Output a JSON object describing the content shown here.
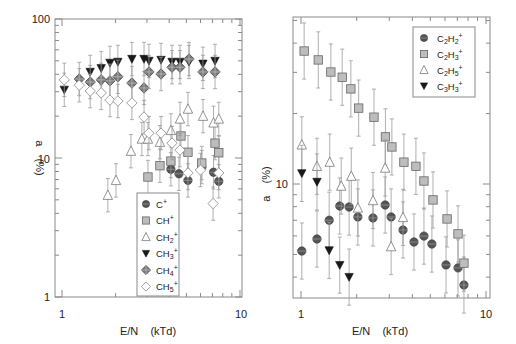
{
  "chart_data": [
    {
      "type": "scatter",
      "title": "",
      "xlabel": "E/N    (kTd)",
      "ylabel": "a    (%)",
      "xscale": "log",
      "yscale": "log",
      "xlim": [
        0.96,
        10.1
      ],
      "ylim": [
        1,
        100
      ],
      "xticks": [
        {
          "value": 1,
          "label": "1"
        },
        {
          "value": 10,
          "label": "10"
        }
      ],
      "yticks": [
        {
          "value": 1,
          "label": "1"
        },
        {
          "value": 10,
          "label": "10"
        },
        {
          "value": 100,
          "label": "100"
        }
      ],
      "legend_position": "bottom-center",
      "series": [
        {
          "name": "C+",
          "base": "C",
          "sub": "",
          "sup": "+",
          "marker": "circle",
          "color": "#555555",
          "x": [
            4.09,
            4.54,
            5.1,
            6.1,
            7.1,
            7.6
          ],
          "y": [
            8.3,
            7.7,
            6.9,
            8.6,
            7.9,
            6.8
          ]
        },
        {
          "name": "CH+",
          "base": "CH",
          "sub": "",
          "sup": "+",
          "marker": "square",
          "color": "#bdbdbd",
          "x": [
            3.04,
            3.55,
            4.09,
            4.66,
            5.1,
            6.1,
            7.24,
            7.6
          ],
          "y": [
            7.3,
            8.8,
            9.5,
            14.4,
            11.0,
            9.2,
            12.8,
            10.9
          ]
        },
        {
          "name": "CH2+",
          "base": "CH",
          "sub": "2",
          "sup": "+",
          "marker": "triangle-up",
          "color": "#ffffff",
          "x": [
            1.81,
            2.01,
            2.44,
            2.81,
            3.04,
            3.55,
            4.09,
            4.6,
            5.1,
            6.2,
            7.1,
            7.6
          ],
          "y": [
            5.4,
            6.9,
            11.2,
            13.7,
            13.7,
            13.0,
            15.8,
            19.1,
            22.5,
            20.0,
            17.9,
            19.1
          ]
        },
        {
          "name": "CH3+",
          "base": "CH",
          "sub": "3",
          "sup": "+",
          "marker": "triangle-down",
          "color": "#1a1a1a",
          "x": [
            1.03,
            1.44,
            1.66,
            1.86,
            2.06,
            2.47,
            2.89,
            3.08,
            3.6,
            4.15,
            4.6,
            5.17,
            6.19,
            7.24
          ],
          "y": [
            30.9,
            41.6,
            44.2,
            48.3,
            49.1,
            51.5,
            51.5,
            49.9,
            50.7,
            49.1,
            49.1,
            49.1,
            47.6,
            49.9
          ]
        },
        {
          "name": "CH4+",
          "base": "CH",
          "sub": "4",
          "sup": "+",
          "marker": "diamond-cross",
          "color": "#7a7a7a",
          "x": [
            1.25,
            1.44,
            1.66,
            1.86,
            2.06,
            2.47,
            2.89,
            3.08,
            3.6,
            4.15,
            4.6,
            5.17,
            6.19,
            7.24
          ],
          "y": [
            37.0,
            35.2,
            36.5,
            35.9,
            38.4,
            34.6,
            31.9,
            41.6,
            40.2,
            45.0,
            45.0,
            51.5,
            41.6,
            41.6
          ]
        },
        {
          "name": "CH5+",
          "base": "CH",
          "sub": "5",
          "sup": "+",
          "marker": "diamond",
          "color": "#ffffff",
          "x": [
            1.03,
            1.25,
            1.44,
            1.66,
            1.86,
            2.06,
            2.47,
            2.89,
            3.08,
            3.6,
            4.15,
            4.6,
            5.1,
            6.0,
            7.06,
            7.6
          ],
          "y": [
            36.5,
            33.4,
            30.3,
            29.4,
            26.1,
            25.7,
            24.9,
            19.7,
            15.1,
            15.1,
            12.8,
            11.4,
            7.8,
            8.2,
            4.7,
            7.8
          ]
        }
      ]
    },
    {
      "type": "scatter",
      "title": "",
      "xlabel": "E/N    (kTd)",
      "ylabel": "a    (%)",
      "xscale": "log",
      "yscale": "log",
      "xlim": [
        0.96,
        10.2
      ],
      "ylim": [
        3.2,
        52
      ],
      "xticks": [
        {
          "value": 1,
          "label": "1"
        },
        {
          "value": 10,
          "label": "10"
        }
      ],
      "yticks": [
        {
          "value": 10,
          "label": "10"
        }
      ],
      "legend_position": "top-right",
      "series": [
        {
          "name": "C2H2+",
          "base": "C",
          "sub": "2",
          "mid": "H",
          "sub2": "2",
          "sup": "+",
          "marker": "circle",
          "color": "#555555",
          "x": [
            1.01,
            1.22,
            1.42,
            1.62,
            1.82,
            2.03,
            2.45,
            2.85,
            3.07,
            3.56,
            4.08,
            4.62,
            5.1,
            6.08,
            7.06,
            7.6
          ],
          "y": [
            5.17,
            5.82,
            7.0,
            8.05,
            7.97,
            7.23,
            7.16,
            8.13,
            7.23,
            6.36,
            5.65,
            5.99,
            5.54,
            4.51,
            4.38,
            3.7
          ]
        },
        {
          "name": "C2H3+",
          "base": "C",
          "sub": "2",
          "mid": "H",
          "sub2": "3",
          "sup": "+",
          "marker": "square",
          "color": "#bdbdbd",
          "x": [
            1.04,
            1.24,
            1.45,
            1.67,
            1.86,
            2.05,
            2.48,
            2.86,
            3.1,
            3.6,
            4.18,
            4.62,
            5.17,
            6.16,
            7.06,
            7.6
          ],
          "y": [
            37.0,
            33.9,
            30.1,
            28.6,
            25.5,
            21.1,
            19.3,
            15.9,
            14.4,
            12.4,
            11.9,
            10.3,
            8.55,
            7.09,
            6.12,
            4.59
          ]
        },
        {
          "name": "C2H5+",
          "base": "C",
          "sub": "2",
          "mid": "H",
          "sub2": "5",
          "sup": "+",
          "marker": "triangle-up",
          "color": "#ffffff",
          "x": [
            1.01,
            1.22,
            1.43,
            1.65,
            1.87,
            2.03,
            2.45,
            2.85,
            3.07,
            3.56
          ],
          "y": [
            14.7,
            11.9,
            12.4,
            9.8,
            10.8,
            7.9,
            8.5,
            11.7,
            5.4,
            7.2
          ]
        },
        {
          "name": "C3H3+",
          "base": "C",
          "sub": "3",
          "mid": "H",
          "sub2": "3",
          "sup": "+",
          "marker": "triangle-down",
          "color": "#1a1a1a",
          "x": [
            1.01,
            1.22,
            1.42,
            1.62,
            1.82
          ],
          "y": [
            11.1,
            10.2,
            5.2,
            4.5,
            4.0
          ]
        }
      ]
    }
  ]
}
